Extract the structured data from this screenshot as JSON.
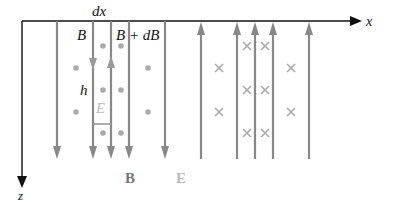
{
  "labels": {
    "x_axis": "x",
    "z_axis": "z",
    "dx": "dx",
    "B_left": "B",
    "B_right": "B + dB",
    "h": "h",
    "E_loop": "E",
    "legend_B": "B",
    "legend_E": "E"
  },
  "colors": {
    "axis": "#111111",
    "field_line": "#888888",
    "marker": "#aaaaaa",
    "legend_B": "#777777",
    "legend_E": "#bbbbbb",
    "text": "#111111"
  },
  "field_lines": {
    "down": [
      57,
      93,
      111,
      129,
      165
    ],
    "up": [
      201,
      237,
      255,
      273,
      309
    ]
  },
  "dots": [
    [
      76,
      68
    ],
    [
      103,
      46
    ],
    [
      121,
      46
    ],
    [
      148,
      68
    ],
    [
      103,
      90
    ],
    [
      121,
      90
    ],
    [
      76,
      112
    ],
    [
      148,
      112
    ],
    [
      103,
      133
    ],
    [
      121,
      133
    ]
  ],
  "crosses": [
    [
      219,
      68
    ],
    [
      247,
      46
    ],
    [
      265,
      46
    ],
    [
      291,
      68
    ],
    [
      247,
      90
    ],
    [
      265,
      90
    ],
    [
      219,
      112
    ],
    [
      291,
      112
    ],
    [
      247,
      133
    ],
    [
      265,
      133
    ]
  ]
}
